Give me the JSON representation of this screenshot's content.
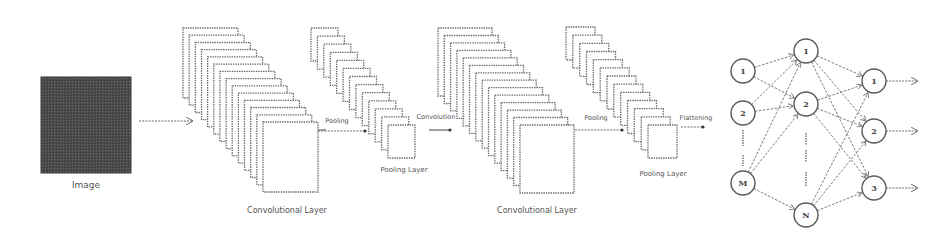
{
  "diagram": {
    "input": {
      "label": "Image",
      "fill": "#4a4a4a"
    },
    "stages": [
      {
        "id": "conv1",
        "type": "convolution",
        "label": "Convolutional Layer",
        "sheet_count": 14
      },
      {
        "id": "pool1",
        "type": "pooling",
        "label": "Pooling Layer",
        "sheet_count": 13
      },
      {
        "id": "conv2",
        "type": "convolution",
        "label": "Convolutional Layer",
        "sheet_count": 14
      },
      {
        "id": "pool2",
        "type": "pooling",
        "label": "Pooling Layer",
        "sheet_count": 13
      }
    ],
    "transitions": {
      "pooling_1": "Pooling",
      "convolution": "Convolution",
      "pooling_2": "Pooling",
      "flattening": "Flattening"
    },
    "network": {
      "input_layer": [
        "1",
        "2",
        "M"
      ],
      "hidden_layer": [
        "1",
        "2",
        "N"
      ],
      "output_layer": [
        "1",
        "2",
        "3"
      ]
    }
  }
}
